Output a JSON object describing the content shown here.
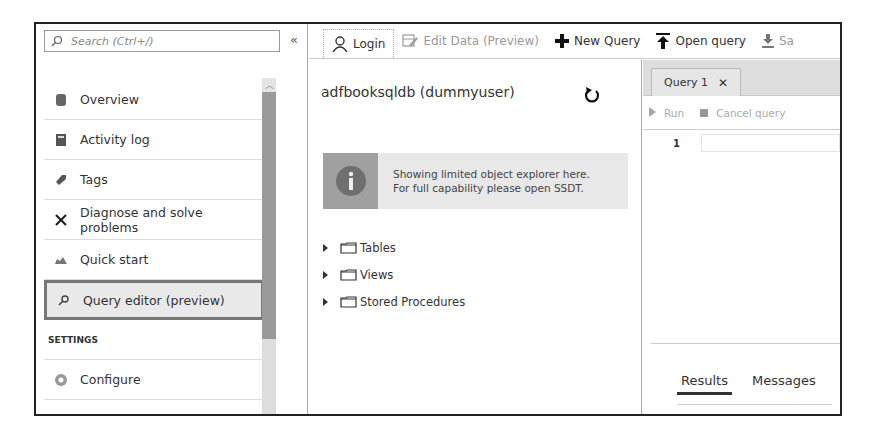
{
  "nav": {
    "search_placeholder": "Search (Ctrl+/)",
    "collapse_label": "«",
    "items": [
      {
        "label": "Overview",
        "icon": "sql-database-icon"
      },
      {
        "label": "Activity log",
        "icon": "activity-log-icon"
      },
      {
        "label": "Tags",
        "icon": "tag-icon"
      },
      {
        "label": "Diagnose and solve problems",
        "icon": "wrench-icon"
      },
      {
        "label": "Quick start",
        "icon": "cloud-icon"
      },
      {
        "label": "Query editor (preview)",
        "icon": "query-editor-icon",
        "selected": true
      }
    ],
    "section": "SETTINGS",
    "settings_items": [
      {
        "label": "Configure",
        "icon": "configure-icon"
      }
    ]
  },
  "toolbar": {
    "login": "Login",
    "edit_data": "Edit Data (Preview)",
    "new_query": "New Query",
    "open_query": "Open query",
    "save": "Sa"
  },
  "explorer": {
    "db_title": "adfbooksqldb (dummyuser)",
    "info_line1": "Showing limited object explorer here.",
    "info_line2": "For full capability please open SSDT.",
    "tree": [
      "Tables",
      "Views",
      "Stored Procedures"
    ]
  },
  "query": {
    "tab_label": "Query 1",
    "tab_close": "✕",
    "run": "Run",
    "cancel": "Cancel query",
    "line_number": "1",
    "result_tabs": [
      "Results",
      "Messages"
    ]
  }
}
